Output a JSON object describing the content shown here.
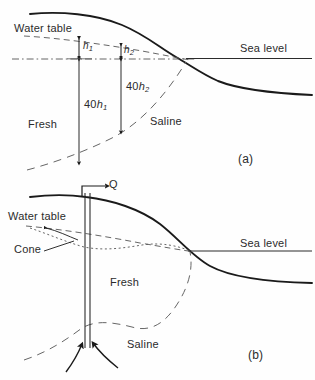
{
  "figure": {
    "panels": [
      {
        "id": "a",
        "marker": "(a)",
        "labels": {
          "water_table": "Water table",
          "sea_level": "Sea level",
          "fresh": "Fresh",
          "saline": "Saline",
          "h1": "h",
          "h1_sub": "1",
          "h2": "h",
          "h2_sub": "2",
          "depth1_coef": "40",
          "depth1": "h",
          "depth1_sub": "1",
          "depth2_coef": "40",
          "depth2": "h",
          "depth2_sub": "2"
        }
      },
      {
        "id": "b",
        "marker": "(b)",
        "labels": {
          "discharge": "Q",
          "water_table": "Water table",
          "cone": "Cone",
          "sea_level": "Sea level",
          "fresh": "Fresh",
          "saline": "Saline"
        }
      }
    ],
    "colors": {
      "ink": "#1a1a1a",
      "line": "#2b2b2b",
      "dash": "#555555",
      "background": "#ffffff"
    }
  }
}
